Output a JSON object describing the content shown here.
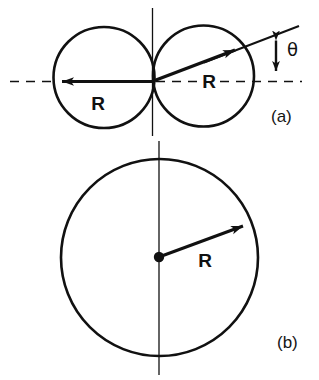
{
  "figure": {
    "title_alt": "Two tangent circles and a single circle diagram",
    "panels": [
      {
        "id": "a",
        "label": "(a)",
        "description": "Two equal circles of radius R tangent at a common point on a vertical axis; a horizontal dashed axis passes through both centers; a left radius arrow labeled R points left, a slanted radius arrow labeled R points up-right, and the angle between the slanted line and the dashed horizontal axis is labeled theta.",
        "radius_labels": [
          "R",
          "R"
        ],
        "angle_label": "θ"
      },
      {
        "id": "b",
        "label": "(b)",
        "description": "A single circle of radius R with a center dot, a vertical axis through the center, and a radius arrow labeled R pointing up-right.",
        "radius_labels": [
          "R"
        ]
      }
    ],
    "colors": {
      "background": "#ffffff",
      "stroke": "#111111",
      "text": "#141414"
    }
  },
  "panel_a": {
    "label": "(a)",
    "left_radius_label": "R",
    "right_radius_label": "R",
    "angle_label": "θ"
  },
  "panel_b": {
    "label": "(b)",
    "radius_label": "R"
  }
}
